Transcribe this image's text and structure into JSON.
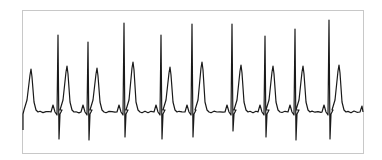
{
  "chart_data": {
    "type": "line",
    "title": "",
    "xlabel": "",
    "ylabel": "",
    "grid": false,
    "legend": null,
    "frame": {
      "x": 22,
      "y": 10,
      "width": 341,
      "height": 143,
      "stroke": "#c8c8c8"
    },
    "line_color": "#1a1a1a",
    "baseline_y": 112,
    "r_peaks": [
      {
        "x": 58,
        "top": 35,
        "bottom": 139
      },
      {
        "x": 88,
        "top": 42,
        "bottom": 140
      },
      {
        "x": 124,
        "top": 23,
        "bottom": 137
      },
      {
        "x": 161,
        "top": 35,
        "bottom": 139
      },
      {
        "x": 192,
        "top": 24,
        "bottom": 137
      },
      {
        "x": 232,
        "top": 24,
        "bottom": 131
      },
      {
        "x": 265,
        "top": 36,
        "bottom": 137
      },
      {
        "x": 295,
        "top": 29,
        "bottom": 140
      },
      {
        "x": 329,
        "top": 20,
        "bottom": 139
      }
    ],
    "t_peaks": [
      {
        "x": 31,
        "y": 69
      },
      {
        "x": 67,
        "y": 66
      },
      {
        "x": 97,
        "y": 68
      },
      {
        "x": 133,
        "y": 62
      },
      {
        "x": 170,
        "y": 67
      },
      {
        "x": 202,
        "y": 62
      },
      {
        "x": 241,
        "y": 65
      },
      {
        "x": 273,
        "y": 66
      },
      {
        "x": 303,
        "y": 66
      },
      {
        "x": 339,
        "y": 65
      }
    ]
  }
}
